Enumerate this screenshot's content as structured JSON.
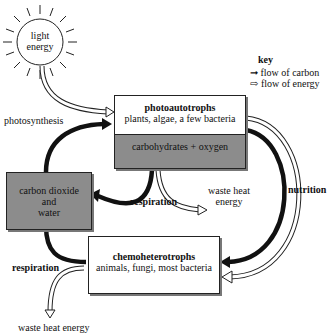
{
  "sun": {
    "label_line1": "light",
    "label_line2": "energy"
  },
  "key": {
    "title": "key",
    "carbon": "➞ flow of carbon",
    "energy": "⇨ flow of energy"
  },
  "photoautotrophs": {
    "title": "photoautotrophs",
    "subtitle": "plants, algae, a few bacteria",
    "product": "carbohydrates + oxygen"
  },
  "co2_box": {
    "line1": "carbon dioxide",
    "line2": "and",
    "line3": "water"
  },
  "chemoheterotrophs": {
    "title": "chemoheterotrophs",
    "subtitle": "animals, fungi, most bacteria"
  },
  "labels": {
    "photosynthesis": "photosynthesis",
    "respiration_top": "respiration",
    "respiration_bottom": "respiration",
    "nutrition": "nutrition",
    "waste_heat_line1": "waste heat",
    "waste_heat_line2": "energy",
    "bottom_cut": "waste heat energy"
  },
  "colors": {
    "box_fill": "#8c8c8c",
    "line": "#111111"
  }
}
